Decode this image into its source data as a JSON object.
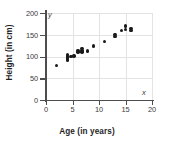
{
  "chart_data": {
    "type": "scatter",
    "title": "",
    "xlabel": "Age (in years)",
    "ylabel": "Height (in cm)",
    "xlim": [
      0,
      20
    ],
    "ylim": [
      0,
      200
    ],
    "xticks": [
      0,
      5,
      10,
      15,
      20
    ],
    "yticks": [
      0,
      50,
      100,
      150,
      200
    ],
    "xtick_labels": [
      "0",
      "5",
      "10",
      "15",
      "20"
    ],
    "ytick_labels": [
      "0",
      "50",
      "100",
      "150",
      "200"
    ],
    "grid": true,
    "legend": null,
    "axis_letters": {
      "x": "x",
      "y": "y"
    },
    "marker_color": "#1a1a1a",
    "grid_color": "#e3e3e3",
    "axis_color": "#4d4d4d",
    "points": [
      {
        "x": 2.0,
        "y": 80
      },
      {
        "x": 4.0,
        "y": 92
      },
      {
        "x": 4.0,
        "y": 97
      },
      {
        "x": 4.0,
        "y": 101
      },
      {
        "x": 4.0,
        "y": 105
      },
      {
        "x": 4.7,
        "y": 100
      },
      {
        "x": 5.3,
        "y": 101
      },
      {
        "x": 6.0,
        "y": 110
      },
      {
        "x": 6.0,
        "y": 114
      },
      {
        "x": 6.8,
        "y": 110
      },
      {
        "x": 6.8,
        "y": 114
      },
      {
        "x": 6.8,
        "y": 118
      },
      {
        "x": 7.8,
        "y": 113
      },
      {
        "x": 9.0,
        "y": 124
      },
      {
        "x": 11.0,
        "y": 134
      },
      {
        "x": 13.0,
        "y": 146
      },
      {
        "x": 13.0,
        "y": 150
      },
      {
        "x": 14.2,
        "y": 160
      },
      {
        "x": 15.0,
        "y": 162
      },
      {
        "x": 15.0,
        "y": 170
      },
      {
        "x": 16.0,
        "y": 160
      },
      {
        "x": 16.0,
        "y": 164
      }
    ]
  }
}
